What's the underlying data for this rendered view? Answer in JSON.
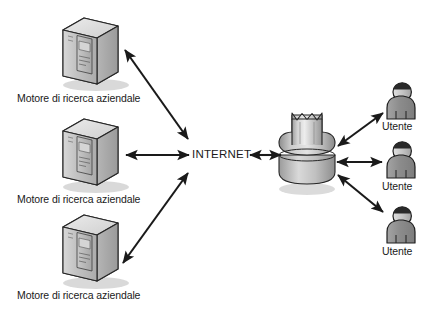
{
  "diagram": {
    "type": "network-topology",
    "background_color": "#ffffff",
    "stroke_color": "#1a1a1a",
    "text_color": "#1a1a1a",
    "icon_fill_light": "#e3e3e3",
    "icon_fill_mid": "#bdbdbd",
    "icon_fill_dark": "#8f8f8f",
    "shadow_color": "#c9c9c9"
  },
  "center": {
    "internet_label": "INTERNET",
    "gateway_name": "gateway-firewall"
  },
  "servers": [
    {
      "label": "Motore di ricerca aziendale",
      "icon": "server-tower-icon"
    },
    {
      "label": "Motore di ricerca aziendale",
      "icon": "server-tower-icon"
    },
    {
      "label": "Motore di ricerca aziendale",
      "icon": "server-tower-icon"
    }
  ],
  "users": [
    {
      "label": "Utente",
      "icon": "user-person-icon"
    },
    {
      "label": "Utente",
      "icon": "user-person-icon"
    },
    {
      "label": "Utente",
      "icon": "user-person-icon"
    }
  ],
  "connections": [
    {
      "from": "server-1",
      "to": "internet",
      "style": "double-arrow"
    },
    {
      "from": "server-2",
      "to": "internet",
      "style": "double-arrow"
    },
    {
      "from": "server-3",
      "to": "internet",
      "style": "double-arrow"
    },
    {
      "from": "internet",
      "to": "gateway",
      "style": "double-arrow"
    },
    {
      "from": "gateway",
      "to": "user-1",
      "style": "double-arrow"
    },
    {
      "from": "gateway",
      "to": "user-2",
      "style": "double-arrow"
    },
    {
      "from": "gateway",
      "to": "user-3",
      "style": "double-arrow"
    }
  ]
}
